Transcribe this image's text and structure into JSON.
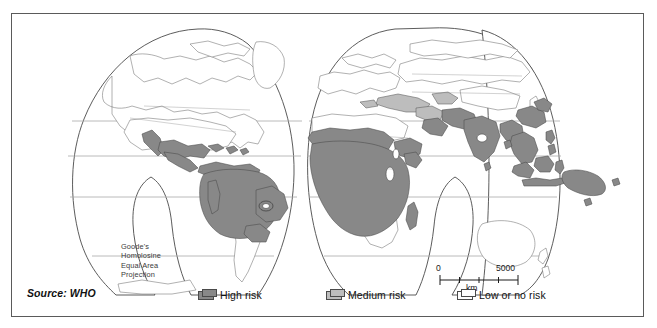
{
  "figure": {
    "source_label": "Source: WHO",
    "projection_label": "Goode's\nHomolosine\nEqual Area\nProjection"
  },
  "scalebar": {
    "min_label": "0",
    "max_label": "5000",
    "unit_label": "km",
    "ticks": 5
  },
  "legend": {
    "items": [
      {
        "label": "High risk",
        "color": "#888888",
        "key": "high"
      },
      {
        "label": "Medium risk",
        "color": "#bdbdbd",
        "key": "medium"
      },
      {
        "label": "Low or no risk",
        "color": "#ffffff",
        "key": "low"
      }
    ]
  },
  "map": {
    "projection": "Goode's Homolosine Equal Area",
    "graticule_latitudes": [
      120,
      155,
      196,
      255
    ],
    "outline_color": "#4a4a4a",
    "graticule_color": "#a8a8a8",
    "country_border_color": "#707070",
    "regions_high_risk": [
      "Central America",
      "Amazon Basin",
      "northern South America",
      "Sub-Saharan Africa",
      "Indian subcontinent",
      "Southeast Asia",
      "Indonesia",
      "Papua New Guinea",
      "southern China"
    ],
    "regions_medium_risk": [
      "Turkey",
      "Middle East",
      "North Africa fringe",
      "Anatolia"
    ],
    "regions_low_risk": [
      "North America",
      "Europe",
      "Russia",
      "Australia",
      "New Zealand",
      "southern South America",
      "southern Africa"
    ]
  }
}
